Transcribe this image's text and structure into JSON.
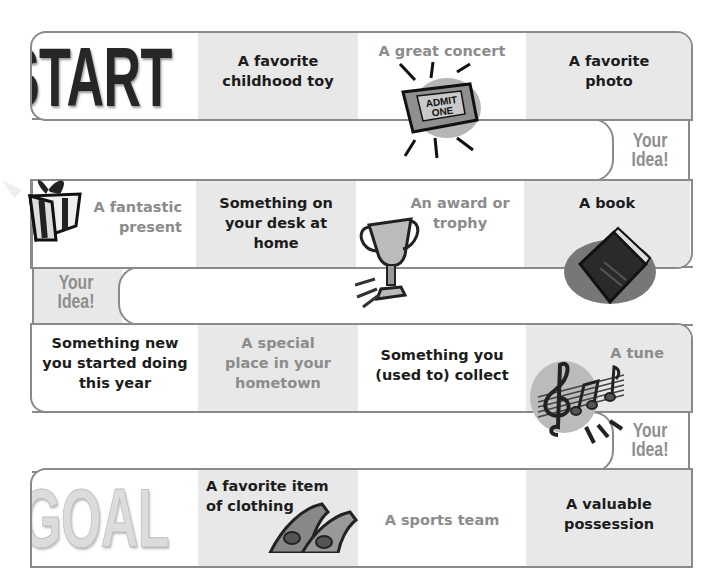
{
  "board": {
    "start_label": "START",
    "goal_label": "GOAL",
    "your_idea_label_line1": "Your",
    "your_idea_label_line2": "Idea!",
    "colors": {
      "border": "#8a8a8a",
      "shaded_cell": "#e8e8e8",
      "dark_text": "#1c1c1c",
      "light_text": "#8c8c8c"
    }
  },
  "row1": {
    "cells": [
      {
        "text": "START"
      },
      {
        "line1": "A favorite",
        "line2": "childhood toy"
      },
      {
        "line1": "A great concert",
        "icon": "admit-one-ticket-icon",
        "ticket_line1": "ADMIT",
        "ticket_line2": "ONE"
      },
      {
        "line1": "A favorite",
        "line2": "photo"
      }
    ]
  },
  "row2": {
    "cells": [
      {
        "line1": "A fantastic",
        "line2": "present",
        "icon": "gift-box-icon"
      },
      {
        "line1": "Something on",
        "line2": "your desk at",
        "line3": "home"
      },
      {
        "line1": "An award or",
        "line2": "trophy",
        "icon": "trophy-icon"
      },
      {
        "line1": "A book",
        "icon": "book-icon"
      }
    ]
  },
  "row3": {
    "cells": [
      {
        "line1": "Something new",
        "line2": "you started doing",
        "line3": "this year"
      },
      {
        "line1": "A special",
        "line2": "place in your",
        "line3": "hometown"
      },
      {
        "line1": "Something you",
        "line2": "(used to) collect"
      },
      {
        "line1": "A tune",
        "icon": "music-notes-icon"
      }
    ]
  },
  "row4": {
    "cells": [
      {
        "text": "GOAL"
      },
      {
        "line1": "A favorite item",
        "line2": "of clothing",
        "icon": "shoes-icon"
      },
      {
        "line1": "A sports team"
      },
      {
        "line1": "A valuable",
        "line2": "possession"
      }
    ]
  }
}
